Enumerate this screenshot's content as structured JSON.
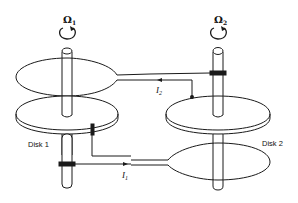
{
  "diagram": {
    "type": "coupled disk dynamo schematic",
    "labels": {
      "omega1": "Ω",
      "omega1_sub": "1",
      "omega2": "Ω",
      "omega2_sub": "2",
      "disk1": "Disk 1",
      "disk2": "Disk 2",
      "current1": "I",
      "current1_sub": "1",
      "current2": "I",
      "current2_sub": "2"
    },
    "components": [
      {
        "id": "axle-1",
        "kind": "rotating shaft",
        "rotation": "Ω1"
      },
      {
        "id": "axle-2",
        "kind": "rotating shaft",
        "rotation": "Ω2"
      },
      {
        "id": "disk-1",
        "kind": "conducting disk",
        "label": "Disk 1"
      },
      {
        "id": "disk-2",
        "kind": "conducting disk",
        "label": "Disk 2"
      },
      {
        "id": "coil-1",
        "kind": "coil loop around axle 1 (upper)",
        "carries": "I2"
      },
      {
        "id": "coil-2",
        "kind": "coil loop around axle 2 (lower)",
        "carries": "I1"
      },
      {
        "id": "brush-rim-1",
        "kind": "rim brush on disk 1"
      },
      {
        "id": "brush-axle-1",
        "kind": "axle brush on shaft 1"
      },
      {
        "id": "brush-rim-2",
        "kind": "rim brush on disk 2"
      },
      {
        "id": "brush-axle-2",
        "kind": "axle brush on shaft 2"
      }
    ],
    "colors": {
      "line": "#1a1a1a",
      "background": "#ffffff"
    }
  }
}
